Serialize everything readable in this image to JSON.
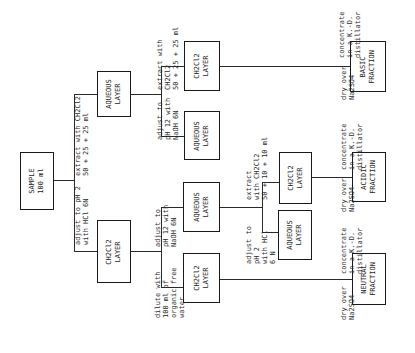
{
  "boxes": {
    "sample": [
      "SAMPLE",
      "100 ml"
    ],
    "aqueous_1": [
      "AQUEOUS",
      "LAYER"
    ],
    "ch2cl2_1": [
      "CH2Cl2",
      "LAYER"
    ],
    "ch2cl2_2": [
      "CH2Cl2",
      "LAYER"
    ],
    "aqueous_2": [
      "AQUEOUS",
      "LAYER"
    ],
    "aqueous_3": [
      "AQUEOUS",
      "LAYER"
    ],
    "ch2cl2_3": [
      "CH2Cl2",
      "LAYER"
    ],
    "ch2cl2_4": [
      "CH2Cl2",
      "LAYER"
    ],
    "aqueous_4": [
      "AQUEOUS",
      "LAYER"
    ],
    "basic": [
      "BASIC",
      "FRACTION"
    ],
    "acidic": [
      "ACIDIC",
      "FRACTION"
    ],
    "neutral": [
      "NEUTRAL",
      "FRACTION"
    ]
  },
  "labels": {
    "extract_1": [
      "extract with CH2Cl2",
      "50 + 25 + 25 ml"
    ],
    "adjust_ph2": [
      "adjust to pH 2",
      "with HCl 6N"
    ],
    "extract_2": [
      "extract with",
      "CH2Cl2",
      "50 + 25 + 25 ml"
    ],
    "adjust_ph12_top": [
      "adjust to",
      "pH 12 with",
      "NaOH 6N"
    ],
    "adjust_ph12_mid": [
      "adjust to",
      "pH 12 with",
      "NaOH 6N"
    ],
    "dilute": [
      "dilute with",
      "100 ml of",
      "organic free",
      "water"
    ],
    "extract_3": [
      "extract",
      "with CH2Cl2",
      "50 + 10 + 10 ml"
    ],
    "adjust_ph2_b": [
      "adjust to",
      "pH 2",
      "with HCl",
      "6 N"
    ],
    "dry_basic": [
      "dry over",
      "Na2SO4"
    ],
    "conc_basic": [
      "concentrate",
      "in a K.-D.",
      "distillator"
    ],
    "dry_acidic": [
      "dry over",
      "Na2SO4"
    ],
    "conc_acidic": [
      "concentrate",
      "in a K.-D.",
      "distillator"
    ],
    "dry_neutral": [
      "dry over",
      "Na2SO4"
    ],
    "conc_neutral": [
      "concentrate",
      "in a K.-D.",
      "distillator"
    ]
  }
}
